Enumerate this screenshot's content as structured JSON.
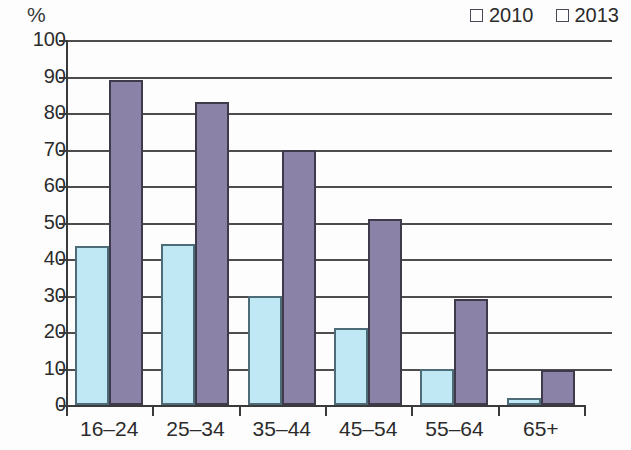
{
  "chart_data": {
    "type": "bar",
    "title": "",
    "subtitle": "",
    "xlabel": "",
    "ylabel": "%",
    "ylim": [
      0,
      100
    ],
    "ytick_step": 10,
    "yticks": [
      "100",
      "90",
      "80",
      "70",
      "60",
      "50",
      "40",
      "30",
      "20",
      "10",
      "0"
    ],
    "grid": true,
    "legend_position": "top-right",
    "categories": [
      "16–24",
      "25–34",
      "35–44",
      "45–54",
      "55–64",
      "65+"
    ],
    "series": [
      {
        "name": "2010",
        "color": "#bfe7f4",
        "values": [
          43.5,
          44,
          30,
          21,
          10,
          2
        ]
      },
      {
        "name": "2013",
        "color": "#8b82a8",
        "values": [
          89,
          83,
          70,
          51,
          29,
          9.5
        ]
      }
    ]
  },
  "legend": {
    "items": [
      {
        "label": "2010",
        "swatch": "#bfe7f4",
        "icon": "square-swatch-icon"
      },
      {
        "label": "2013",
        "swatch": "#8b82a8",
        "icon": "square-swatch-icon"
      }
    ]
  },
  "axis": {
    "y_unit": "%"
  }
}
